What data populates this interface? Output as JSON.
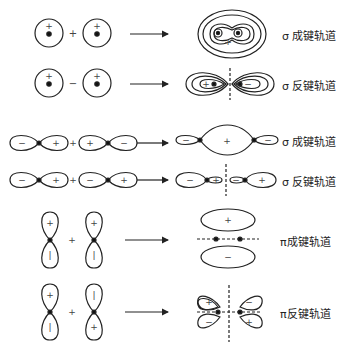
{
  "rows": [
    {
      "id": "s-sigma-bonding",
      "left_signs": [
        "+",
        "+"
      ],
      "operator": "+",
      "label": "σ 成键轨道"
    },
    {
      "id": "s-sigma-antibonding",
      "left_signs": [
        "+",
        "+"
      ],
      "operator": "−",
      "label": "σ 反键轨道"
    },
    {
      "id": "p-sigma-bonding",
      "left_signs": [
        "−",
        "+",
        "+",
        "−"
      ],
      "operator": "+",
      "result_signs": [
        "−",
        "+",
        "−"
      ],
      "label": "σ 成键轨道"
    },
    {
      "id": "p-sigma-antibonding",
      "left_signs": [
        "−",
        "+",
        "−",
        "+"
      ],
      "operator": "+",
      "result_signs": [
        "−",
        "+",
        "−",
        "+"
      ],
      "label": "σ 反键轨道"
    },
    {
      "id": "pi-bonding",
      "left_signs": [
        "+",
        "−",
        "+",
        "−"
      ],
      "operator": "+",
      "result_signs": [
        "+",
        "−"
      ],
      "label": "π成键轨道"
    },
    {
      "id": "pi-antibonding",
      "left_signs": [
        "+",
        "−",
        "−",
        "+"
      ],
      "operator": "+",
      "result_signs": [
        "+",
        "−",
        "−",
        "+"
      ],
      "label": "π反键轨道"
    }
  ]
}
